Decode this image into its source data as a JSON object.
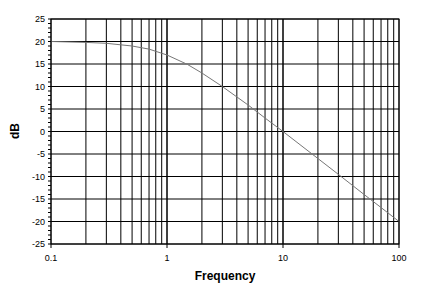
{
  "chart_data": {
    "type": "line",
    "title": "",
    "xlabel": "Frequency",
    "ylabel": "dB",
    "x_scale": "log",
    "xlim": [
      0.1,
      100
    ],
    "ylim": [
      -25,
      25
    ],
    "grid": true,
    "legend": null,
    "x_tick_labels": [
      "0.1",
      "1",
      "10",
      "100"
    ],
    "y_tick_labels": [
      "25",
      "20",
      "15",
      "10",
      "5",
      "0",
      "-5",
      "-10",
      "-15",
      "-20",
      "-25"
    ],
    "series": [
      {
        "name": "magnitude",
        "color": "#777777",
        "x": [
          0.1,
          0.2,
          0.3,
          0.5,
          0.7,
          1,
          1.5,
          2,
          3,
          5,
          7,
          10,
          20,
          30,
          50,
          70,
          100
        ],
        "values": [
          20.0,
          19.8,
          19.6,
          19.0,
          18.3,
          17.0,
          14.9,
          13.0,
          10.0,
          5.9,
          3.0,
          0.0,
          -6.0,
          -9.5,
          -14.0,
          -16.9,
          -20.0
        ]
      }
    ]
  }
}
